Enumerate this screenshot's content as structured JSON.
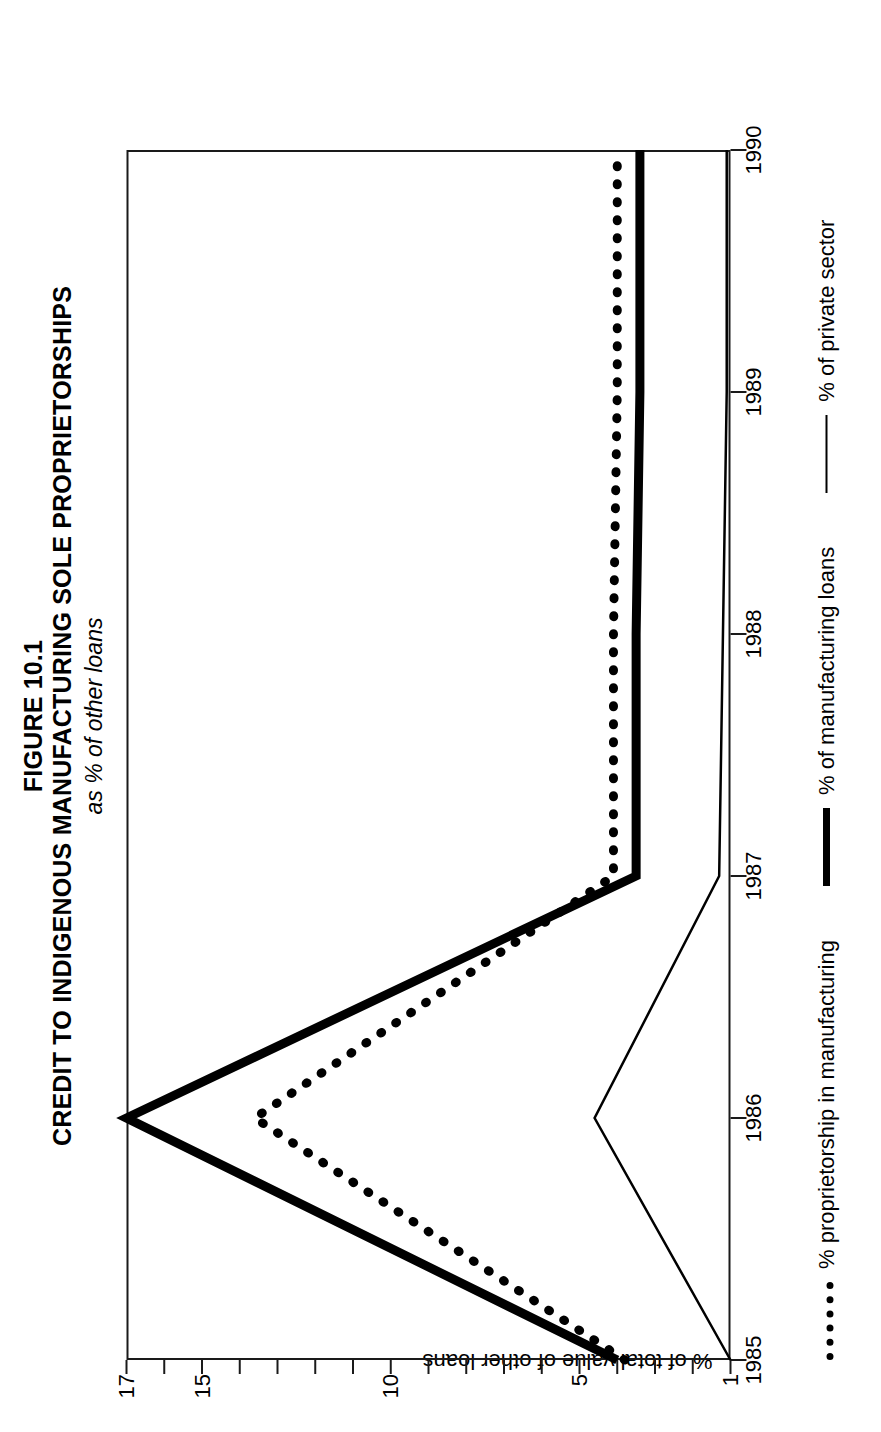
{
  "figure": {
    "number": "FIGURE 10.1",
    "title": "CREDIT TO INDIGENOUS MANUFACTURING SOLE PROPRIETORSHIPS",
    "subtitle": "as % of other loans"
  },
  "axes": {
    "ylabel": "% of total value of other loans",
    "xlabel": ""
  },
  "legend": {
    "items": [
      {
        "label": "% proprietorship in manufacturing",
        "style": "dotted"
      },
      {
        "label": "% of manufacturing loans",
        "style": "bold"
      },
      {
        "label": "% of private sector",
        "style": "thin"
      }
    ]
  },
  "chart_data": {
    "type": "line",
    "title": "CREDIT TO INDIGENOUS MANUFACTURING SOLE PROPRIETORSHIPS",
    "subtitle": "as % of other loans",
    "xlabel": "",
    "ylabel": "% of total value of other loans",
    "x": [
      1985,
      1986,
      1987,
      1988,
      1989,
      1990
    ],
    "categories": [
      "1985",
      "1986",
      "1987",
      "1988",
      "1989",
      "1990"
    ],
    "xlim": [
      1985,
      1990
    ],
    "ylim": [
      1,
      17
    ],
    "yticks": [
      1,
      5,
      10,
      15,
      17
    ],
    "ytick_labels": [
      "1",
      "5",
      "10",
      "15",
      "17"
    ],
    "xticks": [
      1985,
      1986,
      1987,
      1988,
      1989,
      1990
    ],
    "xtick_labels": [
      "1985",
      "1986",
      "1987",
      "1988",
      "1989",
      "1990"
    ],
    "grid": false,
    "legend_position": "bottom",
    "series": [
      {
        "name": "% proprietorship in manufacturing",
        "style": "dotted",
        "values": [
          3.8,
          13.6,
          4.1,
          4.1,
          4.0,
          4.0
        ]
      },
      {
        "name": "% of manufacturing loans",
        "style": "bold",
        "values": [
          4.0,
          17.0,
          3.5,
          3.5,
          3.4,
          3.4
        ]
      },
      {
        "name": "% of private sector",
        "style": "thin",
        "values": [
          1.0,
          4.6,
          1.3,
          1.2,
          1.1,
          1.1
        ]
      }
    ]
  }
}
